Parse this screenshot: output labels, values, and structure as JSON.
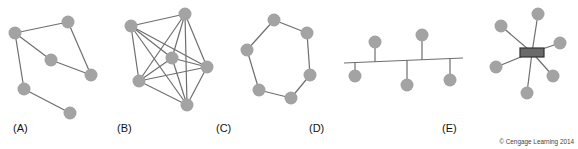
{
  "diagrams": [
    {
      "label": "(A)",
      "topology": "mesh-partial",
      "nodes": [
        [
          15,
          33
        ],
        [
          68,
          22
        ],
        [
          51,
          60
        ],
        [
          91,
          75
        ],
        [
          24,
          89
        ],
        [
          70,
          113
        ]
      ],
      "edges": [
        [
          0,
          1
        ],
        [
          1,
          3
        ],
        [
          3,
          2
        ],
        [
          2,
          0
        ],
        [
          0,
          4
        ],
        [
          4,
          5
        ]
      ]
    },
    {
      "label": "(B)",
      "topology": "mesh-full",
      "nodes": [
        [
          131,
          26
        ],
        [
          185,
          14
        ],
        [
          172,
          58
        ],
        [
          207,
          67
        ],
        [
          139,
          81
        ],
        [
          187,
          105
        ]
      ],
      "edges": [
        [
          0,
          1
        ],
        [
          0,
          2
        ],
        [
          0,
          3
        ],
        [
          0,
          4
        ],
        [
          0,
          5
        ],
        [
          1,
          2
        ],
        [
          1,
          3
        ],
        [
          1,
          4
        ],
        [
          1,
          5
        ],
        [
          2,
          3
        ],
        [
          2,
          4
        ],
        [
          2,
          5
        ],
        [
          3,
          4
        ],
        [
          3,
          5
        ],
        [
          4,
          5
        ]
      ]
    },
    {
      "label": "(C)",
      "topology": "ring",
      "nodes": [
        [
          274,
          20
        ],
        [
          307,
          33
        ],
        [
          247,
          50
        ],
        [
          310,
          75
        ],
        [
          259,
          90
        ],
        [
          291,
          98
        ]
      ],
      "edges": [
        [
          0,
          1
        ],
        [
          1,
          3
        ],
        [
          3,
          5
        ],
        [
          5,
          4
        ],
        [
          4,
          2
        ],
        [
          2,
          0
        ]
      ]
    },
    {
      "label": "(D)",
      "topology": "bus",
      "bus": [
        344,
        63,
        463,
        58
      ],
      "nodes": [
        [
          375,
          42
        ],
        [
          422,
          35
        ],
        [
          355,
          76
        ],
        [
          407,
          85
        ],
        [
          450,
          80
        ]
      ]
    },
    {
      "label": "(E)",
      "topology": "star",
      "hub": [
        520,
        48,
        24,
        9
      ],
      "nodes": [
        [
          538,
          14
        ],
        [
          501,
          26
        ],
        [
          560,
          43
        ],
        [
          496,
          67
        ],
        [
          553,
          76
        ],
        [
          527,
          93
        ]
      ]
    }
  ],
  "label_positions": [
    [
      13,
      122
    ],
    [
      117,
      122
    ],
    [
      216,
      122
    ],
    [
      309,
      122
    ],
    [
      442,
      122
    ]
  ],
  "credit": "© Cengage Learning 2014",
  "colors": {
    "node": "#a3a3a3",
    "edge": "#6e6e6e",
    "hub": "#6a6a6a"
  }
}
